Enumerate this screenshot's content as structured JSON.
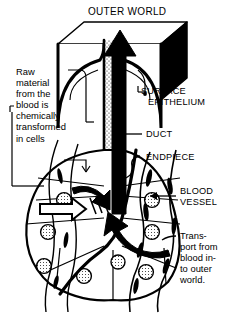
{
  "figure": {
    "title": "OUTER WORLD",
    "palette": {
      "ink": "#000000",
      "paper": "#ffffff",
      "stipple": "#111111"
    },
    "labels": {
      "outer_world": "OUTER WORLD",
      "surface_epithelium_line1": "SURFACE",
      "surface_epithelium_line2": "EPITHELIUM",
      "duct": "DUCT",
      "endpiece": "ENDPIECE",
      "blood_vessel_line1": "BLOOD",
      "blood_vessel_line2": "VESSEL",
      "raw_material": "Raw\nmaterial\nfrom the\nblood is\nchemically\ntransformed\nin cells",
      "transport": "Trans-\nport from\nblood in-\nto outer\nworld."
    },
    "icons": {
      "secretion_arrow": "thick-up-arrow-icon",
      "uptake_arrow": "open-right-arrow-icon",
      "transport_arrow": "curved-arrow-icon"
    }
  }
}
